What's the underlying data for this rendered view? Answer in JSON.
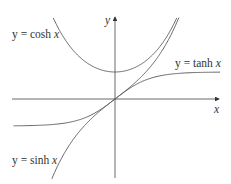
{
  "chart_data": {
    "type": "line",
    "title": "",
    "xlabel": "x",
    "ylabel": "y",
    "grid": false,
    "legend": "inline labels",
    "xlim": [
      -2.9,
      3.0
    ],
    "ylim": [
      -2.9,
      3.0
    ],
    "series": [
      {
        "name": "y = cosh x",
        "function": "cosh",
        "label_pos": "upper-left"
      },
      {
        "name": "y = tanh x",
        "function": "tanh",
        "label_pos": "right"
      },
      {
        "name": "y = sinh x",
        "function": "sinh",
        "label_pos": "lower-left"
      }
    ],
    "annotations": [
      "tanh x approaches horizontal asymptotes y = 1 and y = -1",
      "cosh x has minimum value 1 at x = 0",
      "sinh x and tanh x pass through origin"
    ]
  },
  "labels": {
    "cosh": {
      "prefix": "y = cosh ",
      "var": "x"
    },
    "tanh": {
      "prefix": "y = tanh ",
      "var": "x"
    },
    "sinh": {
      "prefix": "y = sinh ",
      "var": "x"
    },
    "x_axis": "x",
    "y_axis": "y"
  },
  "colors": {
    "axis": "#444444",
    "curve": "#555555",
    "text": "#333333"
  }
}
